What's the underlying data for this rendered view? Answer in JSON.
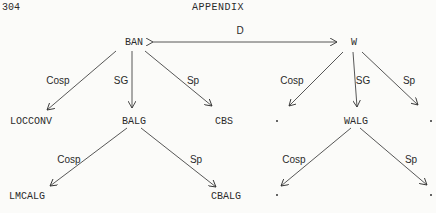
{
  "page": {
    "number": "304",
    "header": "APPENDIX"
  },
  "nodes": {
    "ban": "BAN",
    "w": "W",
    "locconv": "LOCCONV",
    "balg": "BALG",
    "cbs": "CBS",
    "walg": "WALG",
    "lmcalg": "LMCALG",
    "cbalg": "CBALG"
  },
  "edge_labels": {
    "d": "D",
    "ban_cosp": "Cosp",
    "ban_sg": "SG",
    "ban_sp": "Sp",
    "w_cosp": "Cosp",
    "w_sg": "SG",
    "w_sp": "Sp",
    "balg_cosp": "Cosp",
    "balg_sp": "Sp",
    "walg_cosp": "Cosp",
    "walg_sp": "Sp"
  }
}
